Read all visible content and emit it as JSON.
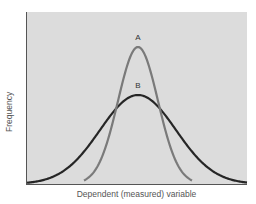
{
  "chart_data": {
    "type": "line",
    "title": "",
    "xlabel": "Dependent (measured) variable",
    "ylabel": "Frequency",
    "grid": false,
    "legend": "none",
    "annotations": [
      {
        "text": "A",
        "position": "above peak of narrow curve"
      },
      {
        "text": "B",
        "position": "above peak of wide curve"
      }
    ],
    "series": [
      {
        "name": "A",
        "shape": "normal distribution (narrow, tall)",
        "relative_peak": 1.0,
        "relative_spread": 0.45,
        "color": "#7a7a7a"
      },
      {
        "name": "B",
        "shape": "normal distribution (wide, shorter)",
        "relative_peak": 0.65,
        "relative_spread": 1.0,
        "color": "#262626"
      }
    ],
    "axis_ticks": "none"
  },
  "colors": {
    "panel": "#dcdcdc",
    "axis": "#555555",
    "curve_a": "#7a7a7a",
    "curve_b": "#262626"
  },
  "labels": {
    "peak_a": "A",
    "peak_b": "B",
    "x_axis": "Dependent (measured) variable",
    "y_axis": "Frequency"
  }
}
